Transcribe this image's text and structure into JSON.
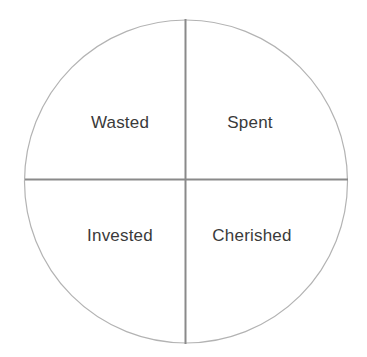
{
  "diagram": {
    "type": "quadrant-circle",
    "title": "",
    "background_color": "#ffffff",
    "circle": {
      "name": "outer-circle",
      "center_x": 186,
      "center_y": 181,
      "radius": 162,
      "stroke_color": "#b3b3b3",
      "stroke_width": 1.2,
      "fill": "none"
    },
    "axes": {
      "stroke_color": "#8a8a8a",
      "stroke_width": 2,
      "vertical": {
        "name": "vertical-divider",
        "x": 185,
        "y1": 19,
        "y2": 344
      },
      "horizontal": {
        "name": "horizontal-divider",
        "y": 179,
        "x1": 25,
        "x2": 348
      }
    },
    "label_color": "#3a3a3a",
    "quadrants": [
      {
        "id": "top-left",
        "label": "Wasted",
        "x": 120,
        "y": 122
      },
      {
        "id": "top-right",
        "label": "Spent",
        "x": 250,
        "y": 122
      },
      {
        "id": "bottom-left",
        "label": "Invested",
        "x": 120,
        "y": 235
      },
      {
        "id": "bottom-right",
        "label": "Cherished",
        "x": 252,
        "y": 235
      }
    ]
  }
}
